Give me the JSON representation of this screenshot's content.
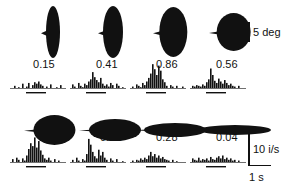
{
  "figure": {
    "title": "",
    "background_color": "#ffffff",
    "ink_color": "#111111"
  },
  "scales": {
    "deg": {
      "label": "5 deg",
      "value": 5,
      "unit": "deg",
      "orientation": "vertical"
    },
    "rate": {
      "label": "10 i/s",
      "value": 10,
      "unit": "i/s",
      "orientation": "vertical"
    },
    "time": {
      "label": "1 s",
      "value": 1,
      "unit": "s",
      "orientation": "horizontal"
    }
  },
  "chart_data": {
    "type": "bar",
    "title": "",
    "xlabel": "1 s",
    "ylabel": "10 i/s",
    "grid": false,
    "legend": null,
    "stimulus_marker": "horizontal bar below baseline = stimulus on",
    "panels": [
      {
        "id": "r1c1",
        "row": 1,
        "col": 1,
        "response": "0.15",
        "response_value": 0.15,
        "shape": {
          "type": "teardrop",
          "orientation": "vertical",
          "rx": 7,
          "ry": 26,
          "tip": "left"
        },
        "values": [
          0,
          0,
          3,
          0,
          1,
          0,
          6,
          0,
          2,
          7,
          0,
          4,
          8,
          6,
          9,
          5,
          3,
          0,
          2,
          0,
          5,
          0,
          0,
          1,
          0,
          4,
          0,
          0
        ],
        "stim_start_index": 8,
        "stim_end_index": 17
      },
      {
        "id": "r1c2",
        "row": 1,
        "col": 2,
        "response": "0.41",
        "response_value": 0.41,
        "shape": {
          "type": "teardrop",
          "orientation": "vertical",
          "rx": 10,
          "ry": 26,
          "tip": "left"
        },
        "values": [
          0,
          5,
          2,
          0,
          7,
          3,
          1,
          6,
          4,
          9,
          12,
          22,
          15,
          11,
          8,
          14,
          6,
          3,
          5,
          2,
          7,
          4,
          0,
          6,
          3,
          0,
          1,
          0
        ],
        "stim_start_index": 8,
        "stim_end_index": 17
      },
      {
        "id": "r1c3",
        "row": 1,
        "col": 3,
        "response": "0.86",
        "response_value": 0.86,
        "shape": {
          "type": "teardrop",
          "orientation": "vertical",
          "rx": 14,
          "ry": 25,
          "tip": "left"
        },
        "values": [
          0,
          2,
          0,
          5,
          3,
          1,
          7,
          4,
          9,
          14,
          20,
          33,
          26,
          18,
          31,
          24,
          12,
          8,
          3,
          0,
          4,
          2,
          0,
          3,
          0,
          0,
          2,
          0
        ],
        "stim_start_index": 8,
        "stim_end_index": 17
      },
      {
        "id": "r1c4",
        "row": 1,
        "col": 4,
        "response": "0.56",
        "response_value": 0.56,
        "shape": {
          "type": "teardrop",
          "orientation": "round",
          "rx": 17,
          "ry": 19,
          "tip": "left"
        },
        "values": [
          0,
          3,
          2,
          4,
          3,
          2,
          5,
          3,
          8,
          12,
          27,
          18,
          10,
          7,
          13,
          9,
          6,
          11,
          7,
          4,
          6,
          3,
          2,
          0,
          3,
          0,
          0,
          0
        ],
        "stim_start_index": 8,
        "stim_end_index": 17
      },
      {
        "id": "r2c1",
        "row": 2,
        "col": 1,
        "response": "1",
        "response_value": 1,
        "shape": {
          "type": "teardrop",
          "orientation": "horizontal",
          "rx": 21,
          "ry": 15,
          "tip": "left"
        },
        "values": [
          0,
          4,
          0,
          6,
          3,
          0,
          5,
          2,
          9,
          18,
          26,
          22,
          34,
          20,
          29,
          16,
          10,
          5,
          3,
          6,
          2,
          0,
          4,
          0,
          2,
          0,
          0,
          0
        ],
        "stim_start_index": 8,
        "stim_end_index": 17
      },
      {
        "id": "r2c2",
        "row": 2,
        "col": 2,
        "response": "0.91",
        "response_value": 0.91,
        "shape": {
          "type": "teardrop",
          "orientation": "horizontal",
          "rx": 26,
          "ry": 11,
          "tip": "left"
        },
        "values": [
          0,
          3,
          0,
          6,
          2,
          0,
          4,
          2,
          11,
          32,
          24,
          14,
          8,
          5,
          17,
          9,
          14,
          6,
          3,
          0,
          5,
          2,
          0,
          4,
          0,
          0,
          1,
          0
        ],
        "stim_start_index": 8,
        "stim_end_index": 17
      },
      {
        "id": "r2c3",
        "row": 2,
        "col": 3,
        "response": "0.28",
        "response_value": 0.28,
        "shape": {
          "type": "teardrop",
          "orientation": "horizontal",
          "rx": 31,
          "ry": 7,
          "tip": "left"
        },
        "values": [
          0,
          2,
          0,
          3,
          2,
          5,
          3,
          6,
          4,
          9,
          14,
          8,
          11,
          6,
          9,
          5,
          7,
          4,
          3,
          2,
          0,
          3,
          0,
          1,
          0,
          0,
          0,
          0
        ],
        "stim_start_index": 8,
        "stim_end_index": 17
      },
      {
        "id": "r2c4",
        "row": 2,
        "col": 4,
        "response": "0.04",
        "response_value": 0.04,
        "shape": {
          "type": "teardrop",
          "orientation": "horizontal",
          "rx": 36,
          "ry": 5,
          "tip": "left"
        },
        "values": [
          0,
          5,
          3,
          2,
          6,
          2,
          4,
          3,
          5,
          2,
          7,
          4,
          3,
          6,
          8,
          5,
          9,
          4,
          6,
          3,
          5,
          2,
          3,
          0,
          2,
          0,
          0,
          0
        ],
        "stim_start_index": 8,
        "stim_end_index": 17
      }
    ]
  }
}
